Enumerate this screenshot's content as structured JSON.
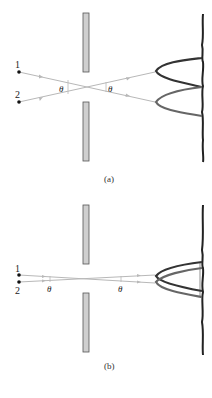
{
  "figure": {
    "panels": [
      {
        "id": "a",
        "caption": "(a)",
        "sources": [
          {
            "label": "1"
          },
          {
            "label": "2"
          }
        ],
        "angle_label_left": "θ",
        "angle_label_right": "θ"
      },
      {
        "id": "b",
        "caption": "(b)",
        "sources": [
          {
            "label": "1"
          },
          {
            "label": "2"
          }
        ],
        "angle_label_left": "θ",
        "angle_label_right": "θ"
      }
    ],
    "colors": {
      "ray": "#b8b8b8",
      "barrier_fill": "#cfcfcf",
      "barrier_edge": "#555555",
      "curve_dark": "#333333",
      "curve_mid": "#666666",
      "screen": "#222222"
    }
  }
}
